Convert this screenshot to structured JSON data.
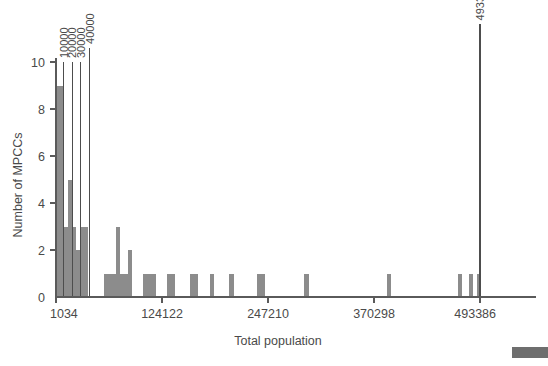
{
  "chart_data": {
    "type": "bar",
    "title": "",
    "subtitle": "",
    "xlabel": "Total population",
    "ylabel": "Number of MPCCs",
    "xlim": [
      1034,
      505000
    ],
    "ylim": [
      0,
      10
    ],
    "grid": false,
    "legend": null,
    "xticks": [
      {
        "value": 1034,
        "label": "1034"
      },
      {
        "value": 124122,
        "label": "124122"
      },
      {
        "value": 247210,
        "label": "247210"
      },
      {
        "value": 370298,
        "label": "370298"
      },
      {
        "value": 493386,
        "label": "493386"
      }
    ],
    "yticks": [
      {
        "value": 0,
        "label": "0"
      },
      {
        "value": 2,
        "label": "2"
      },
      {
        "value": 4,
        "label": "4"
      },
      {
        "value": 6,
        "label": "6"
      },
      {
        "value": 8,
        "label": "8"
      },
      {
        "value": 10,
        "label": "10"
      }
    ],
    "annotations": [
      {
        "name": "reference-line-10000",
        "value": 10000,
        "label": "10000",
        "y_top": 10
      },
      {
        "name": "reference-line-20000",
        "value": 20000,
        "label": "20000",
        "y_top": 10
      },
      {
        "name": "reference-line-30000",
        "value": 30000,
        "label": "30000",
        "y_top": 10
      },
      {
        "name": "reference-line-40000",
        "value": 40000,
        "label": "40000",
        "y_top": 10.6
      },
      {
        "name": "reference-line-493386",
        "value": 493386,
        "label": "493386",
        "y_top": 11.6
      }
    ],
    "bin_width": 4600,
    "categories": [
      3300,
      8000,
      12700,
      17300,
      22000,
      26600,
      31300,
      35900,
      59000,
      63600,
      68300,
      72900,
      77600,
      82200,
      86900,
      105000,
      109700,
      114300,
      132000,
      136600,
      159000,
      163700,
      182000,
      205000,
      237000,
      241600,
      292000,
      388000,
      470000,
      483000,
      492000
    ],
    "values": [
      9,
      9,
      3,
      5,
      3,
      2,
      3,
      3,
      1,
      1,
      1,
      3,
      1,
      1,
      2,
      1,
      1,
      1,
      1,
      1,
      1,
      1,
      1,
      1,
      1,
      1,
      1,
      1,
      1,
      1,
      1
    ],
    "bars": [
      {
        "x": 3300,
        "y": 9,
        "label": ""
      },
      {
        "x": 8000,
        "y": 9,
        "label": ""
      },
      {
        "x": 12700,
        "y": 3,
        "label": ""
      },
      {
        "x": 17300,
        "y": 5,
        "label": ""
      },
      {
        "x": 22000,
        "y": 3,
        "label": ""
      },
      {
        "x": 26600,
        "y": 2,
        "label": ""
      },
      {
        "x": 31300,
        "y": 3,
        "label": ""
      },
      {
        "x": 35900,
        "y": 3,
        "label": ""
      },
      {
        "x": 59000,
        "y": 1,
        "label": ""
      },
      {
        "x": 63600,
        "y": 1,
        "label": ""
      },
      {
        "x": 68300,
        "y": 1,
        "label": ""
      },
      {
        "x": 72900,
        "y": 3,
        "label": ""
      },
      {
        "x": 77600,
        "y": 1,
        "label": ""
      },
      {
        "x": 82200,
        "y": 1,
        "label": ""
      },
      {
        "x": 86900,
        "y": 2,
        "label": ""
      },
      {
        "x": 105000,
        "y": 1,
        "label": ""
      },
      {
        "x": 109700,
        "y": 1,
        "label": ""
      },
      {
        "x": 114300,
        "y": 1,
        "label": ""
      },
      {
        "x": 132000,
        "y": 1,
        "label": ""
      },
      {
        "x": 136600,
        "y": 1,
        "label": ""
      },
      {
        "x": 159000,
        "y": 1,
        "label": ""
      },
      {
        "x": 163700,
        "y": 1,
        "label": ""
      },
      {
        "x": 182000,
        "y": 1,
        "label": ""
      },
      {
        "x": 205000,
        "y": 1,
        "label": ""
      },
      {
        "x": 237000,
        "y": 1,
        "label": ""
      },
      {
        "x": 241600,
        "y": 1,
        "label": ""
      },
      {
        "x": 292000,
        "y": 1,
        "label": ""
      },
      {
        "x": 388000,
        "y": 1,
        "label": ""
      },
      {
        "x": 470000,
        "y": 1,
        "label": ""
      },
      {
        "x": 483000,
        "y": 1,
        "label": ""
      },
      {
        "x": 492000,
        "y": 1,
        "label": ""
      }
    ],
    "colors": {
      "bar": "#8c8c8c",
      "axis": "#5a5a5a",
      "text": "#4a4a4a",
      "annotation_line": "#4d4d4d",
      "background": "#ffffff",
      "corner_swatch": "#6e6e6e"
    }
  }
}
